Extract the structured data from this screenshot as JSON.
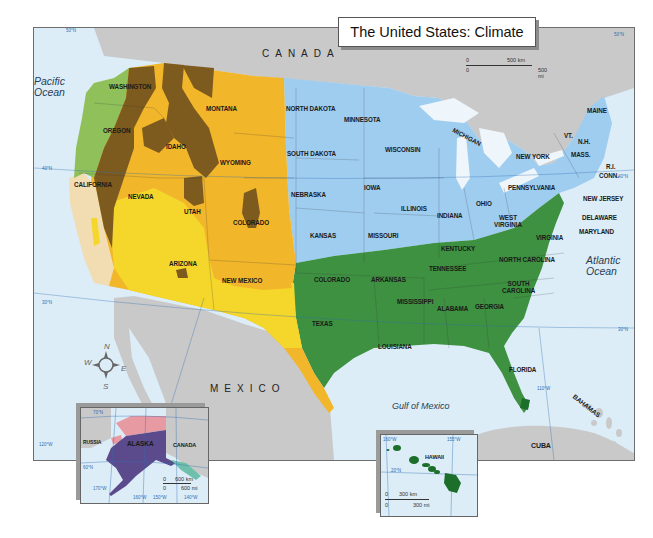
{
  "title": "The United States: Climate",
  "countries": {
    "canada": "CANADA",
    "mexico": "MEXICO",
    "cuba": "CUBA",
    "bahamas": "BAHAMAS",
    "russia": "RUSSIA",
    "canada_inset": "CANADA"
  },
  "oceans": {
    "pacific": "Pacific Ocean",
    "pacific_line1": "Pacific",
    "pacific_line2": "Ocean",
    "atlantic_line1": "Atlantic",
    "atlantic_line2": "Ocean",
    "gulf": "Gulf of Mexico"
  },
  "scale_main": {
    "km_zero": "0",
    "km_label": "500 km",
    "mi_zero": "0",
    "mi_label": "500 mi"
  },
  "states": [
    {
      "name": "WASHINGTON"
    },
    {
      "name": "OREGON"
    },
    {
      "name": "IDAHO"
    },
    {
      "name": "MONTANA"
    },
    {
      "name": "WYOMING"
    },
    {
      "name": "CALIFORNIA"
    },
    {
      "name": "NEVADA"
    },
    {
      "name": "UTAH"
    },
    {
      "name": "COLORADO"
    },
    {
      "name": "ARIZONA"
    },
    {
      "name": "NEW MEXICO"
    },
    {
      "name": "NORTH DAKOTA"
    },
    {
      "name": "SOUTH DAKOTA"
    },
    {
      "name": "NEBRASKA"
    },
    {
      "name": "KANSAS"
    },
    {
      "name": "MINNESOTA"
    },
    {
      "name": "IOWA"
    },
    {
      "name": "MISSOURI"
    },
    {
      "name": "WISCONSIN"
    },
    {
      "name": "MICHIGAN"
    },
    {
      "name": "ILLINOIS"
    },
    {
      "name": "INDIANA"
    },
    {
      "name": "OHIO"
    },
    {
      "name": "PENNSYLVANIA"
    },
    {
      "name": "NEW YORK"
    },
    {
      "name": "VT."
    },
    {
      "name": "N.H."
    },
    {
      "name": "MAINE"
    },
    {
      "name": "MASS."
    },
    {
      "name": "R.I."
    },
    {
      "name": "CONN."
    },
    {
      "name": "NEW JERSEY"
    },
    {
      "name": "DELAWARE"
    },
    {
      "name": "MARYLAND"
    },
    {
      "name": "WEST VIRGINIA"
    },
    {
      "name": "VIRGINIA"
    },
    {
      "name": "KENTUCKY"
    },
    {
      "name": "TENNESSEE"
    },
    {
      "name": "NORTH CAROLINA"
    },
    {
      "name": "SOUTH CAROLINA"
    },
    {
      "name": "GEORGIA"
    },
    {
      "name": "ALABAMA"
    },
    {
      "name": "MISSISSIPPI"
    },
    {
      "name": "ARKANSAS"
    },
    {
      "name": "LOUISIANA"
    },
    {
      "name": "TEXAS"
    },
    {
      "name": "COLORADO"
    },
    {
      "name": "FLORIDA"
    }
  ],
  "labels": {
    "washington": "WASHINGTON",
    "oregon": "OREGON",
    "idaho": "IDAHO",
    "montana": "MONTANA",
    "wyoming": "WYOMING",
    "california": "CALIFORNIA",
    "nevada": "NEVADA",
    "utah": "UTAH",
    "colorado": "COLORADO",
    "arizona": "ARIZONA",
    "new_mexico": "NEW MEXICO",
    "north_dakota": "NORTH DAKOTA",
    "south_dakota": "SOUTH DAKOTA",
    "nebraska": "NEBRASKA",
    "kansas": "KANSAS",
    "minnesota": "MINNESOTA",
    "iowa": "IOWA",
    "missouri": "MISSOURI",
    "wisconsin": "WISCONSIN",
    "michigan": "MICHIGAN",
    "illinois": "ILLINOIS",
    "indiana": "INDIANA",
    "ohio": "OHIO",
    "pennsylvania": "PENNSYLVANIA",
    "new_york": "NEW YORK",
    "vt": "VT.",
    "nh": "N.H.",
    "maine": "MAINE",
    "mass": "MASS.",
    "ri": "R.I.",
    "conn": "CONN.",
    "new_jersey": "NEW JERSEY",
    "delaware": "DELAWARE",
    "maryland": "MARYLAND",
    "west_virginia_1": "WEST",
    "west_virginia_2": "VIRGINIA",
    "virginia": "VIRGINIA",
    "kentucky": "KENTUCKY",
    "tennessee": "TENNESSEE",
    "north_carolina": "NORTH CAROLINA",
    "south_carolina_1": "SOUTH",
    "south_carolina_2": "CAROLINA",
    "georgia": "GEORGIA",
    "alabama": "ALABAMA",
    "mississippi": "MISSISSIPPI",
    "arkansas": "ARKANSAS",
    "louisiana": "LOUISIANA",
    "texas": "TEXAS",
    "oklahoma_area": "COLORADO",
    "florida": "FLORIDA"
  },
  "graticule": {
    "lat_50": "50°N",
    "lat_50_right": "50°N",
    "lat_40": "40°N",
    "lat_40_right": "40°N",
    "lat_30": "30°N",
    "lat_30_right": "30°N",
    "lon_120": "120°W",
    "lon_110": "110°W"
  },
  "compass": {
    "n": "N",
    "s": "S",
    "e": "E",
    "w": "W"
  },
  "alaska_inset": {
    "label": "ALASKA",
    "russia": "RUSSIA",
    "canada": "CANADA",
    "lat_70": "70°N",
    "lat_60": "60°N",
    "lon_170": "170°W",
    "lon_160": "160°W",
    "lon_150": "150°W",
    "lon_140": "140°W",
    "scale": {
      "km_zero": "0",
      "km_label": "600 km",
      "mi_zero": "0",
      "mi_label": "600 mi"
    }
  },
  "hawaii_inset": {
    "label": "HAWAII",
    "lon_160": "160°W",
    "lon_150": "155°W",
    "lat_20": "20°N",
    "scale": {
      "km_zero": "0",
      "km_label": "300 km",
      "mi_zero": "0",
      "mi_label": "300 mi"
    }
  },
  "colors": {
    "ocean": "#dcedf7",
    "foreign_land": "#c9c9c9",
    "marine_west_coast": "#8fc05a",
    "mediterranean": "#f2dcb2",
    "highland": "#7d5a1e",
    "semiarid": "#f2b62a",
    "desert": "#f5d62a",
    "humid_continental": "#9fcdf0",
    "humid_subtropical": "#3d9140",
    "tropical_wet_dry": "#1c6e2b",
    "subarctic": "#5b4a8c",
    "tundra": "#e89aa3",
    "marine_alaska": "#6fc0aa",
    "grid_line": "#2f6eb5",
    "title_bg": "#ffffff"
  }
}
